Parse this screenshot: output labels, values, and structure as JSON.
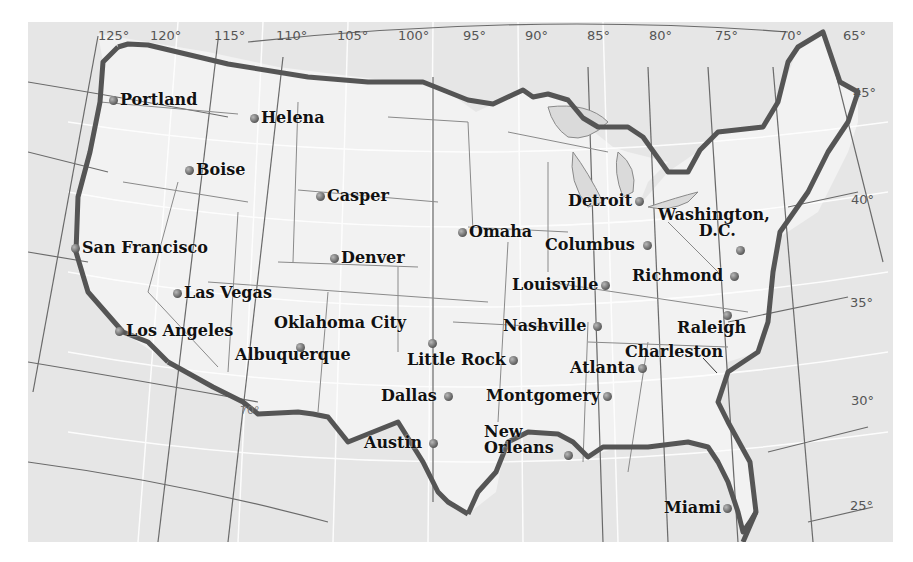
{
  "map": {
    "title": "Contiguous United States — major cities",
    "colors": {
      "land": "#f0f0f0",
      "water": "#dcdcdc",
      "border": "#555555",
      "grid": "#ffffff",
      "graticule": "#6a6a6a",
      "label": "#111111"
    },
    "longitude_ticks": [
      "125°",
      "120°",
      "115°",
      "110°",
      "105°",
      "100°",
      "95°",
      "90°",
      "85°",
      "80°",
      "75°",
      "70°",
      "65°"
    ],
    "latitude_ticks": [
      "45°",
      "40°",
      "35°",
      "30°",
      "25°"
    ],
    "inner_tick": "70°",
    "cities": [
      {
        "name": "Portland"
      },
      {
        "name": "Helena"
      },
      {
        "name": "Boise"
      },
      {
        "name": "Casper"
      },
      {
        "name": "San Francisco"
      },
      {
        "name": "Denver"
      },
      {
        "name": "Las Vegas"
      },
      {
        "name": "Los Angeles"
      },
      {
        "name": "Oklahoma City"
      },
      {
        "name": "Albuquerque"
      },
      {
        "name": "Omaha"
      },
      {
        "name": "Little Rock"
      },
      {
        "name": "Dallas"
      },
      {
        "name": "Austin"
      },
      {
        "name": "Detroit"
      },
      {
        "name": "Columbus"
      },
      {
        "name": "Louisville"
      },
      {
        "name": "Nashville"
      },
      {
        "name": "Atlanta"
      },
      {
        "name": "Montgomery"
      },
      {
        "name": "New"
      },
      {
        "name": "Orleans"
      },
      {
        "name": "Washington,"
      },
      {
        "name": "D.C."
      },
      {
        "name": "Richmond"
      },
      {
        "name": "Raleigh"
      },
      {
        "name": "Charleston"
      },
      {
        "name": "Miami"
      }
    ]
  }
}
